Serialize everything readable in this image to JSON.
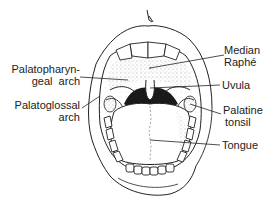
{
  "diagram": {
    "labels": {
      "median_raphe": {
        "line1": "Median",
        "line2": "Raphé"
      },
      "uvula": {
        "line1": "Uvula"
      },
      "palatine_tonsil": {
        "line1": "Palatine",
        "line2": "tonsil"
      },
      "tongue": {
        "line1": "Tongue"
      },
      "palatopharyngeal_arch": {
        "line1": "Palatopharyn-",
        "line2": "geal  arch"
      },
      "palatoglossal_arch": {
        "line1": "Palatoglossal",
        "line2": "arch"
      }
    },
    "colors": {
      "ink": "#222222",
      "stipple": "#555555",
      "throat": "#1a1a1a",
      "background": "#ffffff"
    }
  }
}
